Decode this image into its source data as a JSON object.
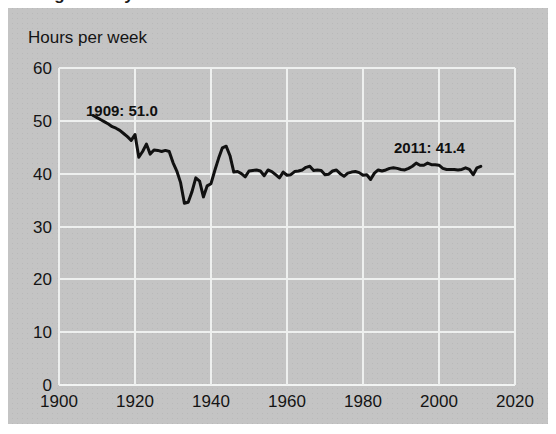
{
  "title": "Average weekly hours",
  "axis_label": "Hours per week",
  "colors": {
    "panel_background": "#c4c4c4",
    "gridline": "#eef0ef",
    "series_line": "#111111",
    "text": "#141414",
    "page_background": "#ffffff"
  },
  "annotations": [
    {
      "name": "start-annotation",
      "text": "1909: 51.0",
      "year": 1909,
      "value": 51.0
    },
    {
      "name": "end-annotation",
      "text": "2011: 41.4",
      "year": 2011,
      "value": 41.4
    }
  ],
  "chart_data": {
    "type": "line",
    "title": "Average weekly hours",
    "subtitle": "",
    "xlabel": "",
    "ylabel": "Hours per week",
    "xlim": [
      1900,
      2020
    ],
    "ylim": [
      0,
      60
    ],
    "xticks": [
      1900,
      1920,
      1940,
      1960,
      1980,
      2000,
      2020
    ],
    "yticks": [
      0,
      10,
      20,
      30,
      40,
      50,
      60
    ],
    "grid": "both",
    "legend": "none",
    "series": [
      {
        "name": "Average weekly hours",
        "x": [
          1909,
          1910,
          1911,
          1912,
          1913,
          1914,
          1915,
          1916,
          1917,
          1918,
          1919,
          1920,
          1921,
          1922,
          1923,
          1924,
          1925,
          1926,
          1927,
          1928,
          1929,
          1930,
          1931,
          1932,
          1933,
          1934,
          1935,
          1936,
          1937,
          1938,
          1939,
          1940,
          1941,
          1942,
          1943,
          1944,
          1945,
          1946,
          1947,
          1948,
          1949,
          1950,
          1951,
          1952,
          1953,
          1954,
          1955,
          1956,
          1957,
          1958,
          1959,
          1960,
          1961,
          1962,
          1963,
          1964,
          1965,
          1966,
          1967,
          1968,
          1969,
          1970,
          1971,
          1972,
          1973,
          1974,
          1975,
          1976,
          1977,
          1978,
          1979,
          1980,
          1981,
          1982,
          1983,
          1984,
          1985,
          1986,
          1987,
          1988,
          1989,
          1990,
          1991,
          1992,
          1993,
          1994,
          1995,
          1996,
          1997,
          1998,
          1999,
          2000,
          2001,
          2002,
          2003,
          2004,
          2005,
          2006,
          2007,
          2008,
          2009,
          2010,
          2011
        ],
        "y": [
          51.0,
          50.6,
          50.2,
          49.8,
          49.4,
          48.9,
          48.6,
          48.2,
          47.6,
          47.0,
          46.3,
          47.4,
          43.1,
          44.2,
          45.6,
          43.7,
          44.5,
          44.4,
          44.2,
          44.4,
          44.2,
          42.1,
          40.5,
          38.3,
          34.4,
          34.6,
          36.6,
          39.2,
          38.6,
          35.6,
          37.7,
          38.1,
          40.6,
          42.9,
          44.9,
          45.2,
          43.4,
          40.3,
          40.4,
          40.0,
          39.4,
          40.5,
          40.6,
          40.7,
          40.5,
          39.6,
          40.7,
          40.4,
          39.8,
          39.2,
          40.3,
          39.7,
          39.8,
          40.4,
          40.5,
          40.7,
          41.2,
          41.4,
          40.6,
          40.7,
          40.6,
          39.8,
          39.9,
          40.5,
          40.7,
          40.0,
          39.5,
          40.1,
          40.3,
          40.4,
          40.2,
          39.7,
          39.8,
          38.9,
          40.1,
          40.7,
          40.5,
          40.7,
          41.0,
          41.1,
          41.0,
          40.8,
          40.7,
          41.0,
          41.4,
          42.0,
          41.6,
          41.6,
          42.0,
          41.7,
          41.7,
          41.6,
          41.0,
          40.8,
          40.8,
          40.8,
          40.7,
          40.8,
          41.1,
          40.8,
          39.8,
          41.1,
          41.4
        ]
      }
    ]
  }
}
